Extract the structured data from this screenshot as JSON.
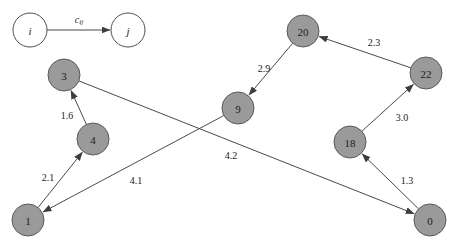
{
  "diagram": {
    "type": "directed-graph",
    "title": "",
    "background_color": "#ffffff",
    "node_fill_color": "#9a9a9a",
    "node_stroke_color": "#5a5a5a",
    "edge_color": "#4a4a4a",
    "node_radius": 16,
    "legend": {
      "source_label": "i",
      "target_label": "j",
      "edge_cost_label": "c",
      "edge_cost_subscript": "ij",
      "source_x": 30,
      "source_y": 30,
      "target_x": 128,
      "target_y": 30,
      "radius": 17
    },
    "nodes": [
      {
        "id": "n3",
        "label": "3",
        "x": 64,
        "y": 75,
        "style": "filled"
      },
      {
        "id": "n4",
        "label": "4",
        "x": 93,
        "y": 139,
        "style": "filled"
      },
      {
        "id": "n1",
        "label": "1",
        "x": 28,
        "y": 220,
        "style": "filled"
      },
      {
        "id": "n9",
        "label": "9",
        "x": 238,
        "y": 108,
        "style": "filled"
      },
      {
        "id": "n20",
        "label": "20",
        "x": 303,
        "y": 31,
        "style": "filled"
      },
      {
        "id": "n22",
        "label": "22",
        "x": 426,
        "y": 73,
        "style": "filled"
      },
      {
        "id": "n18",
        "label": "18",
        "x": 350,
        "y": 142,
        "style": "filled"
      },
      {
        "id": "n0",
        "label": "0",
        "x": 430,
        "y": 220,
        "style": "filled"
      }
    ],
    "edges": [
      {
        "id": "e1",
        "from": "n1",
        "to": "n4",
        "weight": "2.1",
        "label_x": 48,
        "label_y": 177
      },
      {
        "id": "e2",
        "from": "n4",
        "to": "n3",
        "weight": "1.6",
        "label_x": 67,
        "label_y": 115
      },
      {
        "id": "e3",
        "from": "n3",
        "to": "n0",
        "weight": "4.2",
        "label_x": 231,
        "label_y": 155
      },
      {
        "id": "e4",
        "from": "n9",
        "to": "n1",
        "weight": "4.1",
        "label_x": 136,
        "label_y": 180
      },
      {
        "id": "e5",
        "from": "n20",
        "to": "n9",
        "weight": "2.9",
        "label_x": 264,
        "label_y": 68
      },
      {
        "id": "e6",
        "from": "n22",
        "to": "n20",
        "weight": "2.3",
        "label_x": 374,
        "label_y": 42
      },
      {
        "id": "e7",
        "from": "n18",
        "to": "n22",
        "weight": "3.0",
        "label_x": 402,
        "label_y": 117
      },
      {
        "id": "e8",
        "from": "n0",
        "to": "n18",
        "weight": "1.3",
        "label_x": 407,
        "label_y": 180
      }
    ]
  }
}
